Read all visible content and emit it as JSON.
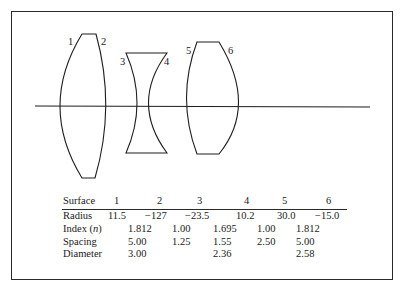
{
  "figure": {
    "type": "lens-system-diagram",
    "surface_labels": [
      "1",
      "2",
      "3",
      "4",
      "5",
      "6"
    ],
    "optical_axis": true,
    "lenses": [
      {
        "name": "biconvex-lens-1",
        "surfaces": [
          "1",
          "2"
        ]
      },
      {
        "name": "biconcave-lens-2",
        "surfaces": [
          "3",
          "4"
        ]
      },
      {
        "name": "biconvex-lens-3",
        "surfaces": [
          "5",
          "6"
        ]
      }
    ]
  },
  "table": {
    "header": {
      "label": "Surface",
      "columns": [
        "1",
        "2",
        "3",
        "4",
        "5",
        "6"
      ]
    },
    "rows": [
      {
        "label": "Radius",
        "values": [
          "11.5",
          "−127",
          "−23.5",
          "10.2",
          "30.0",
          "−15.0"
        ]
      },
      {
        "label": "Index (n)",
        "values": [
          "1.812",
          "1.00",
          "1.695",
          "1.00",
          "1.812"
        ]
      },
      {
        "label": "Spacing",
        "values": [
          "5.00",
          "1.25",
          "1.55",
          "2.50",
          "5.00"
        ]
      },
      {
        "label": "Diameter",
        "values": [
          "3.00",
          "2.36",
          "2.58"
        ]
      }
    ]
  }
}
